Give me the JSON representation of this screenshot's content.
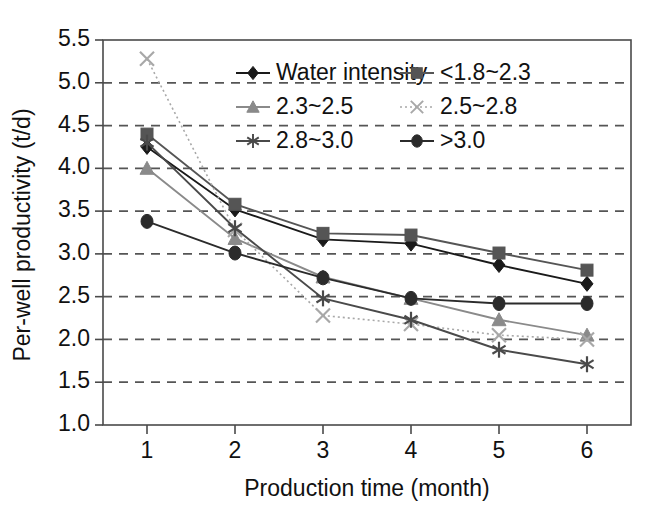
{
  "chart_data": {
    "type": "line",
    "title": "",
    "xlabel": "Production time (month)",
    "ylabel": "Per-well productivity (t/d)",
    "x": [
      1,
      2,
      3,
      4,
      5,
      6
    ],
    "categories": [
      "1",
      "2",
      "3",
      "4",
      "5",
      "6"
    ],
    "xtick_labels": [
      "1",
      "2",
      "3",
      "4",
      "5",
      "6"
    ],
    "ytick_labels": [
      "1.0",
      "1.5",
      "2.0",
      "2.5",
      "3.0",
      "3.5",
      "4.0",
      "4.5",
      "5.0",
      "5.5"
    ],
    "ytick_values": [
      1.0,
      1.5,
      2.0,
      2.5,
      3.0,
      3.5,
      4.0,
      4.5,
      5.0,
      5.5
    ],
    "xlim": [
      0.5,
      6.5
    ],
    "ylim": [
      1.0,
      5.5
    ],
    "grid": "horizontal-dashed",
    "legend_position": "top-center-inside",
    "series": [
      {
        "name": "Water intensity",
        "marker": "diamond",
        "color": "#1a1a1a",
        "linestyle": "solid",
        "values": [
          4.25,
          3.52,
          3.17,
          3.12,
          2.87,
          2.65
        ]
      },
      {
        "name": "<1.8~2.3",
        "marker": "square",
        "color": "#555555",
        "linestyle": "solid",
        "values": [
          4.4,
          3.58,
          3.24,
          3.22,
          3.01,
          2.81
        ]
      },
      {
        "name": "2.3~2.5",
        "marker": "triangle",
        "color": "#8a8a8a",
        "linestyle": "solid",
        "values": [
          4.0,
          3.18,
          2.73,
          2.48,
          2.23,
          2.05
        ]
      },
      {
        "name": "2.5~2.8",
        "marker": "cross-x",
        "color": "#a8a8a8",
        "linestyle": "dotted",
        "values": [
          5.28,
          3.28,
          2.28,
          2.18,
          2.05,
          2.0
        ]
      },
      {
        "name": "2.8~3.0",
        "marker": "asterisk",
        "color": "#4a4a4a",
        "linestyle": "solid",
        "values": [
          4.3,
          3.3,
          2.48,
          2.23,
          1.88,
          1.71
        ]
      },
      {
        "name": ">3.0",
        "marker": "circle",
        "color": "#2b2b2b",
        "linestyle": "solid",
        "values": [
          3.38,
          3.01,
          2.72,
          2.48,
          2.42,
          2.42
        ]
      }
    ]
  }
}
